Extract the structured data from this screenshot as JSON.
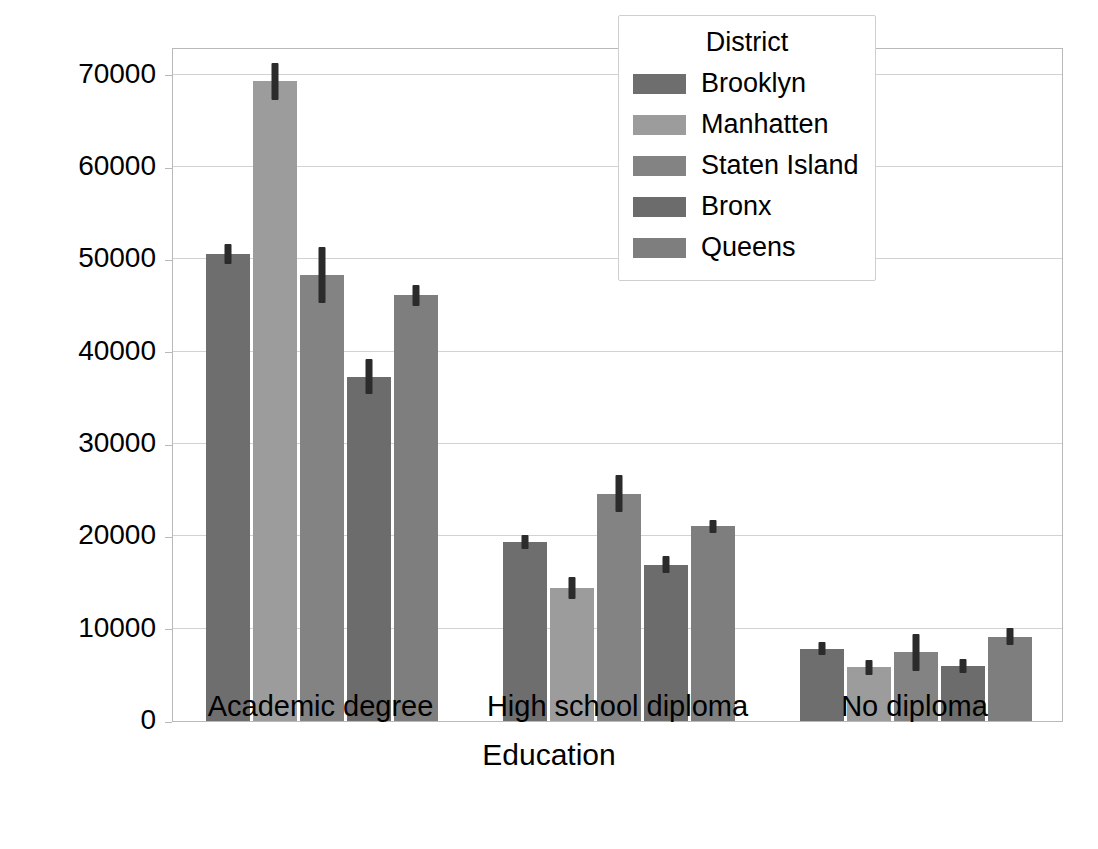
{
  "chart_data": {
    "type": "bar",
    "title": "",
    "xlabel": "Education",
    "ylabel": "Salary",
    "categories": [
      "Academic degree",
      "High school diploma",
      "No diploma"
    ],
    "ylim": [
      0,
      73000
    ],
    "yticks": [
      0,
      10000,
      20000,
      30000,
      40000,
      50000,
      60000,
      70000
    ],
    "ytick_labels": [
      "0",
      "10000",
      "20000",
      "30000",
      "40000",
      "50000",
      "60000",
      "70000"
    ],
    "grid": true,
    "legend": {
      "title": "District",
      "position": "upper right",
      "entries": [
        "Brooklyn",
        "Manhatten",
        "Staten Island",
        "Bronx",
        "Queens"
      ]
    },
    "series": [
      {
        "name": "Brooklyn",
        "color": "#6e6e6e",
        "values": [
          50600,
          19400,
          7850
        ],
        "errors": [
          1100,
          800,
          700
        ]
      },
      {
        "name": "Manhatten",
        "color": "#9c9c9c",
        "values": [
          69300,
          14400,
          5800
        ],
        "errors": [
          2000,
          1200,
          800
        ]
      },
      {
        "name": "Staten Island",
        "color": "#838383",
        "values": [
          48300,
          24600,
          7450
        ],
        "errors": [
          3000,
          2000,
          2000
        ]
      },
      {
        "name": "Bronx",
        "color": "#6c6c6c",
        "values": [
          37300,
          16950,
          5950
        ],
        "errors": [
          1900,
          900,
          800
        ]
      },
      {
        "name": "Queens",
        "color": "#7e7e7e",
        "values": [
          46100,
          21100,
          9150
        ],
        "errors": [
          1100,
          700,
          900
        ]
      }
    ]
  }
}
